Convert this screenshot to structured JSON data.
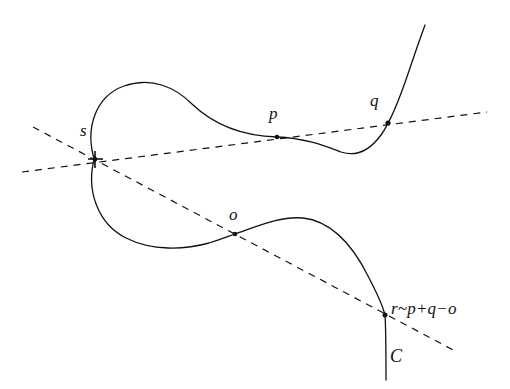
{
  "figure": {
    "kind": "geometry-diagram",
    "background_color": "#ffffff",
    "stroke_color": "#111111",
    "curve_stroke_width": 1.3,
    "dash_stroke_width": 1.2,
    "dash_pattern": "7,6"
  },
  "labels": {
    "node_s": "s",
    "point_p": "p",
    "point_q": "q",
    "point_o": "o",
    "relation_r": "r~p+q−o",
    "curve_c": "C"
  },
  "points": [
    {
      "name": "s",
      "label": "s",
      "x": 95,
      "y": 159,
      "label_x": 80,
      "label_y": 122,
      "marker": "cross-node"
    },
    {
      "name": "p",
      "label": "p",
      "x": 277,
      "y": 137,
      "label_x": 269,
      "label_y": 105,
      "marker": "dot"
    },
    {
      "name": "q",
      "label": "q",
      "x": 388,
      "y": 123,
      "label_x": 370,
      "label_y": 92,
      "marker": "dot"
    },
    {
      "name": "o",
      "label": "o",
      "x": 235,
      "y": 234,
      "label_x": 229,
      "label_y": 206,
      "marker": "dot"
    },
    {
      "name": "r",
      "label": "r~p+q−o",
      "x": 385,
      "y": 315,
      "label_x": 391,
      "label_y": 300,
      "marker": "dot"
    }
  ],
  "curve_label": {
    "text": "C",
    "x": 388,
    "y": 348
  },
  "lines": [
    {
      "name": "secant-p-q",
      "style": "dashed",
      "from": {
        "x": 22,
        "y": 172
      },
      "to": {
        "x": 487,
        "y": 112
      },
      "passes_through": [
        "s",
        "p",
        "q"
      ]
    },
    {
      "name": "secant-s-o-r",
      "style": "dashed",
      "from": {
        "x": 33,
        "y": 127
      },
      "to": {
        "x": 457,
        "y": 352
      },
      "passes_through": [
        "s",
        "o",
        "r"
      ]
    }
  ],
  "curve_branches": [
    {
      "name": "upper-loop",
      "description": "loop from node s arcing up and right to point p"
    },
    {
      "name": "upper-right-branch",
      "description": "through p, dipping to a minimum then rising steeply past q off the top right"
    },
    {
      "name": "lower-loop",
      "description": "loop from node s arcing down and right to point o"
    },
    {
      "name": "lower-right-branch",
      "description": "through o, arcing up then descending steeply through r to a vertical tail labeled C"
    }
  ]
}
